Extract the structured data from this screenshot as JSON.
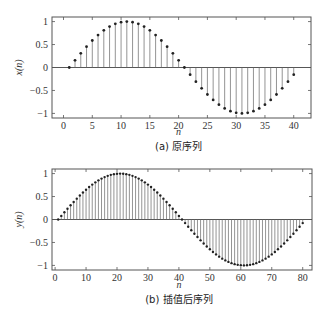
{
  "chart_data": [
    {
      "type": "stem",
      "panel": "a",
      "caption": "(a) 原序列",
      "xlabel": "n",
      "ylabel": "x(n)",
      "xlim": [
        -2,
        43
      ],
      "ylim": [
        -1.1,
        1.1
      ],
      "xticks": [
        0,
        5,
        10,
        15,
        20,
        25,
        30,
        35,
        40
      ],
      "yticks": [
        -1,
        -0.5,
        0,
        0.5,
        1
      ],
      "ytick_labels": [
        "−1",
        "−0.5",
        "0",
        "0.5",
        "1"
      ],
      "grid": false,
      "formula": "x(n) = sin(2π(n−1)/40)",
      "x": [
        1,
        2,
        3,
        4,
        5,
        6,
        7,
        8,
        9,
        10,
        11,
        12,
        13,
        14,
        15,
        16,
        17,
        18,
        19,
        20,
        21,
        22,
        23,
        24,
        25,
        26,
        27,
        28,
        29,
        30,
        31,
        32,
        33,
        34,
        35,
        36,
        37,
        38,
        39,
        40
      ],
      "values": [
        0,
        0.156,
        0.309,
        0.454,
        0.588,
        0.707,
        0.809,
        0.891,
        0.951,
        0.988,
        1,
        0.988,
        0.951,
        0.891,
        0.809,
        0.707,
        0.588,
        0.454,
        0.309,
        0.156,
        0,
        -0.156,
        -0.309,
        -0.454,
        -0.588,
        -0.707,
        -0.809,
        -0.891,
        -0.951,
        -0.988,
        -1,
        -0.988,
        -0.951,
        -0.891,
        -0.809,
        -0.707,
        -0.588,
        -0.454,
        -0.309,
        -0.156
      ]
    },
    {
      "type": "stem",
      "panel": "b",
      "caption": "(b) 插值后序列",
      "xlabel": "n",
      "ylabel": "y(n)",
      "xlim": [
        -1,
        83
      ],
      "ylim": [
        -1.1,
        1.1
      ],
      "xticks": [
        0,
        10,
        20,
        30,
        40,
        50,
        60,
        70,
        80
      ],
      "yticks": [
        -1,
        -0.5,
        0,
        0.5,
        1
      ],
      "ytick_labels": [
        "−1",
        "−0.5",
        "0",
        "0.5",
        "1"
      ],
      "grid": false,
      "formula": "y(n) = sin(2π(n−1)/80)",
      "x_range": [
        1,
        80
      ],
      "period": 80
    }
  ]
}
